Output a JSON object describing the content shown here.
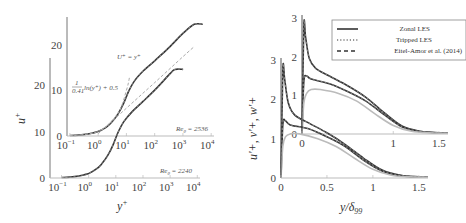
{
  "chart_data": [
    {
      "type": "line",
      "panel": "left-front",
      "title": "",
      "xlabel": "y+",
      "ylabel": "u+",
      "xscale": "log",
      "xlim": [
        0.05,
        10000
      ],
      "ylim": [
        0,
        25
      ],
      "x_ticks": [
        "10^-1",
        "10^0",
        "10^1",
        "10^2",
        "10^3",
        "10^4"
      ],
      "y_ticks": [
        "0",
        "10",
        "20"
      ],
      "annotation": "Re_θ = 2240",
      "grid": false,
      "series": [
        {
          "name": "Zonal LES",
          "style": "solid",
          "color": "#333333",
          "x": [
            0.1,
            0.3,
            1,
            2,
            3,
            5,
            8,
            12,
            20,
            40,
            100,
            300,
            1000,
            1500,
            3000
          ],
          "y": [
            0.1,
            0.3,
            1.0,
            2.0,
            3.0,
            4.8,
            7.2,
            9.8,
            12.2,
            14.3,
            16.5,
            19.2,
            22.5,
            23.4,
            23.4
          ]
        }
      ]
    },
    {
      "type": "line",
      "panel": "left-back",
      "title": "",
      "xlabel": "",
      "ylabel": "",
      "xscale": "log",
      "xlim": [
        0.05,
        10000
      ],
      "ylim": [
        0,
        25
      ],
      "x_ticks": [
        "10^-1",
        "10^0",
        "10^1",
        "10^2",
        "10^3",
        "10^4"
      ],
      "y_ticks": [
        "0",
        "10",
        "20"
      ],
      "annotation": "Re_θ = 2536",
      "grid": false,
      "series": [
        {
          "name": "Zonal LES",
          "style": "solid",
          "color": "#333333",
          "x": [
            0.1,
            0.3,
            1,
            2,
            3,
            5,
            8,
            12,
            20,
            40,
            100,
            300,
            1000,
            2500,
            5000
          ],
          "y": [
            0.1,
            0.3,
            1.0,
            2.0,
            3.0,
            4.8,
            7.2,
            9.8,
            12.2,
            14.3,
            16.5,
            19.2,
            22.5,
            24.5,
            24.5
          ]
        },
        {
          "name": "U+ = y+",
          "style": "dashed",
          "color": "#aaaaaa",
          "x": [
            0.1,
            1,
            5,
            10,
            13
          ],
          "y": [
            0.1,
            1,
            5,
            10,
            13
          ]
        },
        {
          "name": "(1/0.41) ln(y+) + 0.5",
          "style": "dashed",
          "color": "#aaaaaa",
          "x": [
            1,
            10,
            100,
            1000,
            2500
          ],
          "y": [
            0.5,
            6.1,
            11.7,
            17.4,
            19.6
          ]
        }
      ],
      "annotations": [
        "U+ = y+",
        "(1/0.41) ln(y+) + 0.5"
      ]
    },
    {
      "type": "line",
      "panel": "right-front",
      "title": "",
      "xlabel": "y/δ99",
      "ylabel": "u'+, v'+, w'+",
      "xlim": [
        0,
        1.6
      ],
      "ylim": [
        0,
        3
      ],
      "x_ticks": [
        "0",
        "0.5",
        "1",
        "1.5"
      ],
      "y_ticks": [
        "0",
        "1",
        "2",
        "3"
      ],
      "grid": false,
      "series": [
        {
          "name": "u'+",
          "style": "solid",
          "color": "#333333",
          "x": [
            0,
            0.02,
            0.04,
            0.08,
            0.15,
            0.3,
            0.5,
            0.7,
            0.9,
            1.1,
            1.3,
            1.5,
            1.6
          ],
          "y": [
            0,
            2.75,
            2.5,
            1.9,
            1.6,
            1.4,
            1.15,
            0.85,
            0.5,
            0.2,
            0.07,
            0.03,
            0.02
          ]
        },
        {
          "name": "w'+",
          "style": "solid",
          "color": "#333333",
          "x": [
            0,
            0.02,
            0.05,
            0.1,
            0.3,
            0.5,
            0.7,
            0.9,
            1.1,
            1.3,
            1.5,
            1.6
          ],
          "y": [
            0,
            1.35,
            1.45,
            1.35,
            1.25,
            1.05,
            0.8,
            0.45,
            0.18,
            0.06,
            0.03,
            0.02
          ]
        },
        {
          "name": "v'+",
          "style": "solid",
          "color": "#bbbbbb",
          "x": [
            0,
            0.02,
            0.05,
            0.1,
            0.2,
            0.4,
            0.6,
            0.8,
            1.0,
            1.2,
            1.4,
            1.6
          ],
          "y": [
            0,
            0.8,
            1.05,
            1.12,
            1.12,
            1.0,
            0.8,
            0.5,
            0.22,
            0.07,
            0.03,
            0.02
          ]
        }
      ]
    },
    {
      "type": "line",
      "panel": "right-back",
      "title": "",
      "xlabel": "",
      "ylabel": "",
      "xlim": [
        0,
        1.6
      ],
      "ylim": [
        0,
        3
      ],
      "x_ticks": [
        "0",
        "1",
        "1.5"
      ],
      "y_ticks": [
        "0",
        "1",
        "2",
        "3"
      ],
      "grid": false,
      "series": [
        {
          "name": "u'+",
          "style": "solid",
          "color": "#333333",
          "x": [
            0,
            0.02,
            0.04,
            0.08,
            0.15,
            0.3,
            0.5,
            0.7,
            0.9,
            1.1,
            1.3,
            1.5,
            1.6
          ],
          "y": [
            0,
            2.8,
            2.5,
            1.95,
            1.7,
            1.5,
            1.25,
            0.95,
            0.55,
            0.2,
            0.07,
            0.03,
            0.02
          ]
        },
        {
          "name": "w'+",
          "style": "solid",
          "color": "#333333",
          "x": [
            0,
            0.02,
            0.05,
            0.1,
            0.3,
            0.5,
            0.7,
            0.9,
            1.1,
            1.3,
            1.5,
            1.6
          ],
          "y": [
            0,
            1.35,
            1.5,
            1.42,
            1.3,
            1.1,
            0.85,
            0.5,
            0.18,
            0.06,
            0.03,
            0.02
          ]
        },
        {
          "name": "v'+",
          "style": "solid",
          "color": "#bbbbbb",
          "x": [
            0,
            0.02,
            0.05,
            0.1,
            0.2,
            0.4,
            0.6,
            0.8,
            1.0,
            1.2,
            1.4,
            1.6
          ],
          "y": [
            0,
            0.8,
            1.05,
            1.15,
            1.15,
            1.05,
            0.85,
            0.52,
            0.22,
            0.07,
            0.03,
            0.02
          ]
        }
      ]
    }
  ],
  "legend": {
    "position": "upper-right",
    "entries": [
      {
        "label": "Zonal LES",
        "style": "solid"
      },
      {
        "label": "Tripped LES",
        "style": "dotted"
      },
      {
        "label": "Eitel-Amor et al. (2014)",
        "style": "dashed"
      }
    ]
  },
  "labels": {
    "left_xlabel": "y",
    "left_xlabel_sup": "+",
    "left_ylabel": "u",
    "left_ylabel_sup": "+",
    "right_xlabel": "y/δ",
    "right_xlabel_sub": "99",
    "right_ylabel": "u'+, v'+, w'+",
    "annot_re_back": "Re",
    "annot_re_back_sub": "θ",
    "annot_re_back_val": " = 2536",
    "annot_re_front": "Re",
    "annot_re_front_sub": "θ",
    "annot_re_front_val": " = 2240",
    "annot_linear": "U⁺ = y⁺",
    "annot_log": "ln(y⁺) + 0.5",
    "annot_log_frac_num": "1",
    "annot_log_frac_den": "0.41"
  },
  "ticks": {
    "left_back_y": [
      "0",
      "10",
      "20"
    ],
    "left_front_y": [
      "0",
      "10",
      "20"
    ],
    "log_x": [
      {
        "base": "10",
        "exp": "−1"
      },
      {
        "base": "10",
        "exp": "0"
      },
      {
        "base": "10",
        "exp": "1"
      },
      {
        "base": "10",
        "exp": "2"
      },
      {
        "base": "10",
        "exp": "3"
      },
      {
        "base": "10",
        "exp": "4"
      }
    ],
    "right_back_y": [
      "0",
      "1",
      "2",
      "3"
    ],
    "right_front_y": [
      "0",
      "1",
      "2",
      "3"
    ],
    "right_back_x": [
      "0",
      "1",
      "1.5"
    ],
    "right_front_x": [
      "0",
      "0.5",
      "1",
      "1.5"
    ]
  }
}
